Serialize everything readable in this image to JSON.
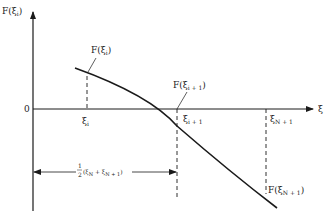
{
  "diagram": {
    "type": "function-plot",
    "y_axis_label": "F(ξ_i)",
    "x_axis_label": "ξ",
    "origin_label": "0",
    "curve_annotations": {
      "point_i": "F(ξ_i)",
      "point_i_plus_1": "F(ξ_{i+1})",
      "point_N_plus_1": "F(ξ_{N+1})"
    },
    "x_ticks": {
      "xi_i": "ξ_i",
      "xi_i_plus_1": "ξ_{i+1}",
      "xi_N_plus_1": "ξ_{N+1}"
    },
    "interval_label": "½(ξ_N + ξ_{N+1})",
    "colors": {
      "line": "#1a1a1a",
      "text": "#222222",
      "background": "#ffffff"
    }
  },
  "text": {
    "y_axis": {
      "main": "F(ξ",
      "sub": "i",
      "close": ")"
    },
    "x_axis": "ξ",
    "origin": "0",
    "f_xi_i": {
      "main": "F(ξ",
      "sub": "i",
      "close": ")"
    },
    "f_xi_i1": {
      "main": "F(ξ",
      "sub": "i + 1",
      "close": ")"
    },
    "f_xi_n1": {
      "main": "F(ξ",
      "sub": "N + 1",
      "close": ")"
    },
    "tick_i": {
      "main": "ξ",
      "sub": "i"
    },
    "tick_i1": {
      "main": "ξ",
      "sub": "i + 1"
    },
    "tick_n1": {
      "main": "ξ",
      "sub": "N + 1"
    },
    "interval": {
      "num": "1",
      "den": "2",
      "expr_open": "(ξ",
      "sub1": "N",
      "plus": " + ξ",
      "sub2": "N + 1",
      "expr_close": ")"
    }
  }
}
